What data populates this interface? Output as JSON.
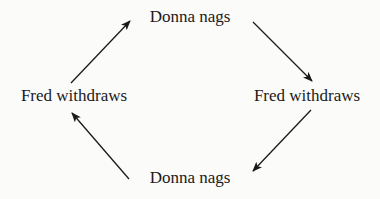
{
  "diagram": {
    "nodes": [
      {
        "id": "top",
        "label": "Donna nags"
      },
      {
        "id": "right",
        "label": "Fred withdraws"
      },
      {
        "id": "bottom",
        "label": "Donna nags"
      },
      {
        "id": "left",
        "label": "Fred withdraws"
      }
    ],
    "edges": [
      {
        "from": "top",
        "to": "right"
      },
      {
        "from": "right",
        "to": "bottom"
      },
      {
        "from": "bottom",
        "to": "left"
      },
      {
        "from": "left",
        "to": "top"
      }
    ]
  }
}
